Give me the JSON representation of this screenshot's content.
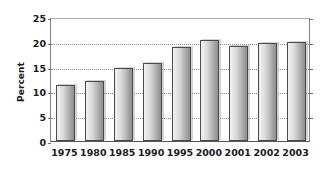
{
  "chart_data": {
    "type": "bar",
    "title": "",
    "xlabel": "",
    "ylabel": "Percent",
    "categories": [
      "1975",
      "1980",
      "1985",
      "1990",
      "1995",
      "2000",
      "2001",
      "2002",
      "2003"
    ],
    "values": [
      11.2,
      12.1,
      14.7,
      15.7,
      19.0,
      20.3,
      19.2,
      19.8,
      20.0
    ],
    "ylim": [
      0,
      25
    ],
    "yticks": [
      0,
      5,
      10,
      15,
      20,
      25
    ],
    "ytick_labels": [
      "0",
      "5",
      "10",
      "15",
      "20",
      "25"
    ],
    "grid": true,
    "grid_style": "dotted-horizontal",
    "legend": null,
    "bar_color": "#c4c4c4",
    "bar_edge_color": "#4a4a4a",
    "axis_color": "#808080",
    "text_color": "#1a1a1a",
    "background": "#ffffff"
  }
}
